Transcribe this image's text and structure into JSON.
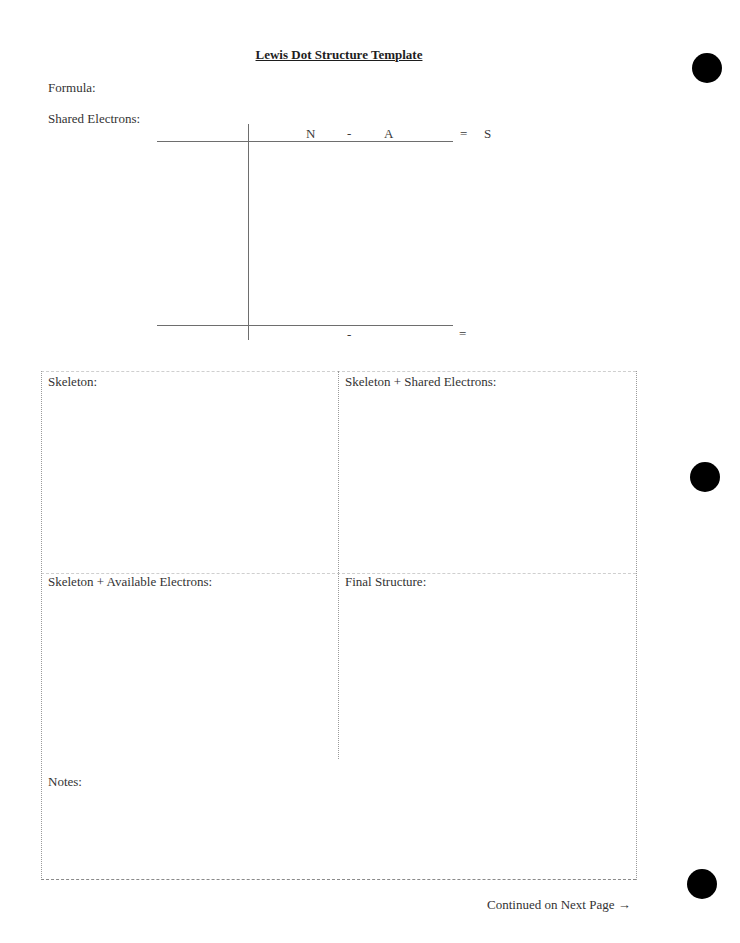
{
  "document": {
    "title": "Lewis Dot Structure Template",
    "formula_label": "Formula:",
    "shared_electrons_label": "Shared Electrons:"
  },
  "t_chart": {
    "header": {
      "n": "N",
      "minus": "-",
      "a": "A",
      "equals": "=",
      "s": "S"
    },
    "footer": {
      "minus": "-",
      "equals": "="
    }
  },
  "boxes": {
    "skeleton": "Skeleton:",
    "skeleton_shared": "Skeleton + Shared Electrons:",
    "skeleton_available": "Skeleton + Available Electrons:",
    "final_structure": "Final Structure:",
    "notes": "Notes:"
  },
  "footer": {
    "continued": "Continued on Next Page →"
  }
}
